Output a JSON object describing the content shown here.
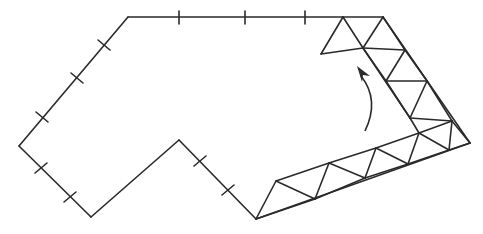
{
  "diagram": {
    "title": "",
    "colors": {
      "stroke": "#2a2a2a",
      "background": "#ffffff"
    },
    "outline": {
      "vertices": [
        [
          128,
          17
        ],
        [
          343,
          17
        ],
        [
          19,
          146
        ],
        [
          91,
          217
        ],
        [
          179,
          140
        ],
        [
          256,
          219
        ]
      ],
      "edges": [
        {
          "from": [
            128,
            17
          ],
          "to": [
            343,
            17
          ]
        },
        {
          "from": [
            128,
            17
          ],
          "to": [
            19,
            146
          ]
        },
        {
          "from": [
            19,
            146
          ],
          "to": [
            91,
            217
          ]
        },
        {
          "from": [
            91,
            217
          ],
          "to": [
            179,
            140
          ]
        },
        {
          "from": [
            179,
            140
          ],
          "to": [
            256,
            219
          ]
        }
      ],
      "tick_marks": [
        {
          "at": [
            179,
            17
          ],
          "dir": "v"
        },
        {
          "at": [
            245,
            17
          ],
          "dir": "v"
        },
        {
          "at": [
            305,
            17
          ],
          "dir": "v"
        },
        {
          "at": [
            104,
            45
          ],
          "dir": "perp-ul"
        },
        {
          "at": [
            77,
            78
          ],
          "dir": "perp-ul"
        },
        {
          "at": [
            42,
            117
          ],
          "dir": "perp-ul"
        },
        {
          "at": [
            41,
            168
          ],
          "dir": "perp-ll"
        },
        {
          "at": [
            70,
            197
          ],
          "dir": "perp-ll"
        },
        {
          "at": [
            200,
            161
          ],
          "dir": "perp-ll"
        },
        {
          "at": [
            228,
            190
          ],
          "dir": "perp-ll"
        }
      ]
    },
    "truss": {
      "nodes": {
        "A": [
          343,
          17
        ],
        "B": [
          383,
          17
        ],
        "C": [
          321,
          54
        ],
        "D": [
          363,
          48
        ],
        "E": [
          405,
          50
        ],
        "F": [
          386,
          81
        ],
        "G": [
          427,
          81
        ],
        "H": [
          410,
          118
        ],
        "I": [
          452,
          121
        ],
        "J": [
          419,
          133
        ],
        "K": [
          470,
          143
        ],
        "L": [
          449,
          150
        ],
        "M": [
          408,
          164
        ],
        "N": [
          376,
          148
        ],
        "O": [
          365,
          178
        ],
        "P": [
          329,
          163
        ],
        "Q": [
          315,
          199
        ],
        "R": [
          276,
          181
        ],
        "S": [
          256,
          219
        ]
      },
      "members": [
        [
          "A",
          "B"
        ],
        [
          "A",
          "C"
        ],
        [
          "C",
          "D"
        ],
        [
          "A",
          "D"
        ],
        [
          "B",
          "D"
        ],
        [
          "D",
          "E"
        ],
        [
          "B",
          "E"
        ],
        [
          "D",
          "F"
        ],
        [
          "E",
          "F"
        ],
        [
          "F",
          "G"
        ],
        [
          "E",
          "G"
        ],
        [
          "F",
          "H"
        ],
        [
          "G",
          "H"
        ],
        [
          "H",
          "I"
        ],
        [
          "G",
          "I"
        ],
        [
          "H",
          "J"
        ],
        [
          "I",
          "J"
        ],
        [
          "I",
          "K"
        ],
        [
          "I",
          "L"
        ],
        [
          "J",
          "L"
        ],
        [
          "L",
          "K"
        ],
        [
          "J",
          "M"
        ],
        [
          "L",
          "M"
        ],
        [
          "J",
          "N"
        ],
        [
          "N",
          "M"
        ],
        [
          "N",
          "O"
        ],
        [
          "O",
          "M"
        ],
        [
          "N",
          "P"
        ],
        [
          "P",
          "O"
        ],
        [
          "P",
          "Q"
        ],
        [
          "O",
          "Q"
        ],
        [
          "P",
          "R"
        ],
        [
          "R",
          "Q"
        ],
        [
          "R",
          "S"
        ],
        [
          "Q",
          "S"
        ],
        [
          "B",
          "K"
        ],
        [
          "K",
          "S"
        ],
        [
          "D",
          "H"
        ]
      ]
    },
    "arrow": {
      "tail": [
        365,
        131
      ],
      "control": [
        380,
        100
      ],
      "tip": [
        357,
        66
      ],
      "meaning": "rotation / folding direction"
    }
  }
}
